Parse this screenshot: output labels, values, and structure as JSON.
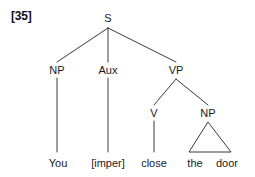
{
  "figure": {
    "example_number": "[35]",
    "sentence": "You [imper] close the door",
    "background_color": "#ffffff",
    "line_color": "#3a3a3a",
    "text_color": "#1a1a1a"
  },
  "tree": {
    "nodes": [
      {
        "id": "S",
        "label": "S",
        "x": 108,
        "y": 18
      },
      {
        "id": "NP1",
        "label": "NP",
        "x": 57,
        "y": 70
      },
      {
        "id": "AUX",
        "label": "Aux",
        "x": 108,
        "y": 70
      },
      {
        "id": "VP",
        "label": "VP",
        "x": 176,
        "y": 70
      },
      {
        "id": "V",
        "label": "V",
        "x": 154,
        "y": 113
      },
      {
        "id": "NP2",
        "label": "NP",
        "x": 208,
        "y": 113
      }
    ],
    "leaves": [
      {
        "id": "L1",
        "label": "You",
        "x": 58,
        "y": 163
      },
      {
        "id": "L2",
        "label": "[imper]",
        "x": 108,
        "y": 163
      },
      {
        "id": "L3",
        "label": "close",
        "x": 154,
        "y": 163
      },
      {
        "id": "L4",
        "label": "the",
        "x": 195,
        "y": 163
      },
      {
        "id": "L5",
        "label": "door",
        "x": 227,
        "y": 163
      }
    ],
    "edges": [
      {
        "from": "S",
        "to": "NP1",
        "x1": 108,
        "y1": 28,
        "x2": 57,
        "y2": 62
      },
      {
        "from": "S",
        "to": "AUX",
        "x1": 108,
        "y1": 28,
        "x2": 108,
        "y2": 62
      },
      {
        "from": "S",
        "to": "VP",
        "x1": 108,
        "y1": 28,
        "x2": 176,
        "y2": 62
      },
      {
        "from": "NP1",
        "to": "L1",
        "x1": 57,
        "y1": 78,
        "x2": 57,
        "y2": 152
      },
      {
        "from": "AUX",
        "to": "L2",
        "x1": 108,
        "y1": 78,
        "x2": 108,
        "y2": 152
      },
      {
        "from": "VP",
        "to": "V",
        "x1": 176,
        "y1": 79,
        "x2": 154,
        "y2": 105
      },
      {
        "from": "VP",
        "to": "NP2",
        "x1": 176,
        "y1": 79,
        "x2": 208,
        "y2": 105
      },
      {
        "from": "V",
        "to": "L3",
        "x1": 154,
        "y1": 121,
        "x2": 154,
        "y2": 152
      }
    ],
    "triangle": {
      "parent": "NP2",
      "covers": "the door",
      "apex_x": 208,
      "apex_y": 122,
      "left_x": 189,
      "right_x": 231,
      "base_y": 152
    }
  }
}
